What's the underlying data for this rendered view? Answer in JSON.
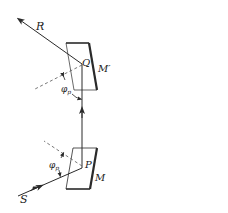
{
  "diagram": {
    "type": "optical-periscope-reflection",
    "labels": {
      "ray_in": "S",
      "ray_out": "R",
      "point_lower": "P",
      "point_upper": "Q",
      "mirror_lower": "M",
      "mirror_upper": "M′",
      "angle_lower": "φ",
      "angle_lower_sub": "p",
      "angle_upper": "φ",
      "angle_upper_sub": "p"
    },
    "colors": {
      "stroke": "#2a2a2a",
      "dashed": "#555555",
      "background": "#ffffff"
    }
  }
}
